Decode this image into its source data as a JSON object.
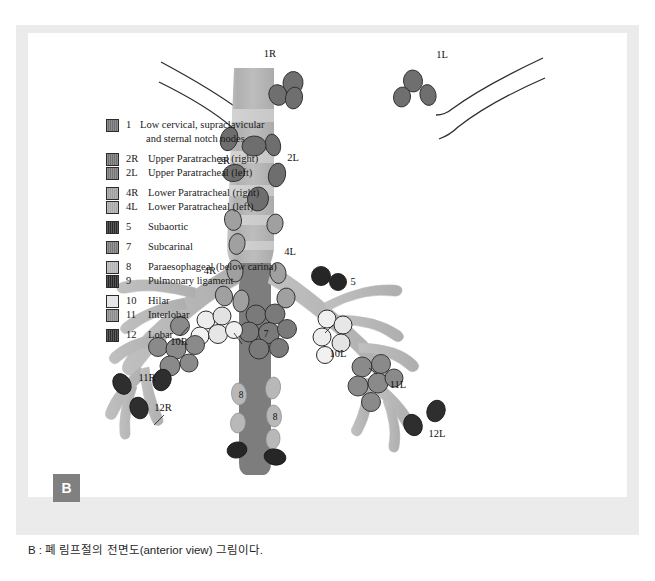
{
  "figure": {
    "badge": "B",
    "caption": "B : 폐 림프절의 전면도(anterior view) 그림이다.",
    "view_label": "anterior view"
  },
  "legend": {
    "groups": [
      {
        "rows": [
          {
            "code": "1",
            "label": "Low cervical, supraclavicular",
            "label2": "and sternal notch nodes",
            "color": "#6f6f6f"
          }
        ]
      },
      {
        "rows": [
          {
            "code": "2R",
            "label": "Upper Paratracheal (right)",
            "color": "#707070"
          },
          {
            "code": "2L",
            "label": "Upper Paratracheal (left)",
            "color": "#767676"
          }
        ]
      },
      {
        "rows": [
          {
            "code": "4R",
            "label": "Lower Paratracheal (right)",
            "color": "#9d9d9d"
          },
          {
            "code": "4L",
            "label": "Lower Paratracheal (left)",
            "color": "#a8a8a8"
          }
        ]
      },
      {
        "rows": [
          {
            "code": "5",
            "label": "Subaortic",
            "color": "#2a2a2a"
          }
        ]
      },
      {
        "rows": [
          {
            "code": "7",
            "label": "Subcarinal",
            "color": "#787878"
          }
        ]
      },
      {
        "rows": [
          {
            "code": "8",
            "label": "Paraesophageal (below carina)",
            "color": "#b4b4b4"
          },
          {
            "code": "9",
            "label": "Pulmonary ligament",
            "color": "#262626"
          }
        ]
      },
      {
        "rows": [
          {
            "code": "10",
            "label": "Hilar",
            "color": "#e2e2e2"
          },
          {
            "code": "11",
            "label": "Interlobar",
            "color": "#8a8a8a"
          }
        ]
      },
      {
        "rows": [
          {
            "code": "12",
            "label": "Lobar",
            "color": "#2e2e2e"
          }
        ]
      }
    ]
  },
  "diagram_labels": {
    "n1r": "1R",
    "n1l": "1L",
    "n2r": "2R",
    "n2l": "2L",
    "n4r": "4R",
    "n4l": "4L",
    "n5": "5",
    "n7": "7",
    "n8a": "8",
    "n8b": "8",
    "n10r": "10R",
    "n10l": "10L",
    "n11r": "11R",
    "n11l": "11L",
    "n12r": "12R",
    "n12l": "12L"
  },
  "colors": {
    "page_background": "#ffffff",
    "card_frame": "#ebebeb",
    "canvas": "#ffffff",
    "airway_light": "#b9b9b9",
    "airway_band_dark": "#9a9a9a",
    "esophagus": "#7a7a7a",
    "bronchus": "#b3b3b3",
    "outline": "#3a3a3a",
    "badge_background": "#808080",
    "badge_text": "#ffffff",
    "node_1": "#6f6f6f",
    "node_2": "#707070",
    "node_4": "#9d9d9d",
    "node_5": "#2a2a2a",
    "node_7": "#787878",
    "node_8": "#b4b4b4",
    "node_9": "#262626",
    "node_10": "#e8e8e8",
    "node_11": "#8a8a8a",
    "node_12": "#2e2e2e"
  }
}
